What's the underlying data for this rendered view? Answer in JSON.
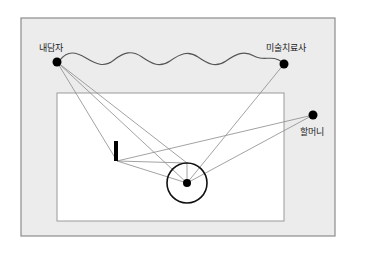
{
  "diagram": {
    "type": "relationship-spatial-diagram",
    "colors": {
      "outer_frame_fill": "#ececec",
      "outer_frame_stroke": "#8c8c8c",
      "inner_rect_fill": "#ffffff",
      "inner_rect_stroke": "#9a9a9a",
      "line": "#8a8a8a",
      "node": "#000000",
      "wave": "#555555"
    },
    "nodes": [
      {
        "id": "client",
        "label": "내담자",
        "x": 57,
        "y": 62,
        "label_x": 39,
        "label_y": 42
      },
      {
        "id": "therapist",
        "label": "미술치료사",
        "x": 284,
        "y": 64,
        "label_x": 268,
        "label_y": 42
      },
      {
        "id": "grandmother",
        "label": "할머니",
        "x": 313,
        "y": 115,
        "label_x": 301,
        "label_y": 126
      }
    ],
    "labels": {
      "client": "내담자",
      "therapist": "미술치료사",
      "grandmother": "할머니"
    },
    "outer_frame": {
      "x": 21,
      "y": 18,
      "w": 314,
      "h": 218
    },
    "inner_rect": {
      "x": 57,
      "y": 93,
      "w": 227,
      "h": 128
    },
    "circle": {
      "cx": 187,
      "cy": 183,
      "r": 20
    },
    "center_dot": {
      "cx": 187,
      "cy": 183,
      "r": 4
    },
    "bar": {
      "x": 114,
      "y": 141,
      "w": 4,
      "h": 20
    }
  }
}
